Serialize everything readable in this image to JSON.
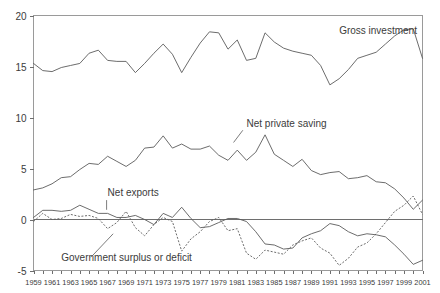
{
  "chart_data": {
    "type": "line",
    "title": "",
    "subtitle": "",
    "xlabel": "",
    "ylabel": "",
    "xlim": [
      1959,
      2001
    ],
    "ylim": [
      -5,
      20
    ],
    "yticks": [
      -5,
      0,
      5,
      10,
      15,
      20
    ],
    "ytick_labels": [
      "-5",
      "0",
      "5",
      "10",
      "15",
      "20"
    ],
    "grid": false,
    "legend_position": "inline-annotations",
    "zero_reference_line": 0,
    "x": [
      1959,
      1960,
      1961,
      1962,
      1963,
      1964,
      1965,
      1966,
      1967,
      1968,
      1969,
      1970,
      1971,
      1972,
      1973,
      1974,
      1975,
      1976,
      1977,
      1978,
      1979,
      1980,
      1981,
      1982,
      1983,
      1984,
      1985,
      1986,
      1987,
      1988,
      1989,
      1990,
      1991,
      1992,
      1993,
      1994,
      1995,
      1996,
      1997,
      1998,
      1999,
      2000,
      2001
    ],
    "xtick_labels": [
      "1959",
      "1961",
      "1963",
      "1965",
      "1967",
      "1969",
      "1971",
      "1973",
      "1975",
      "1977",
      "1979",
      "1981",
      "1983",
      "1985",
      "1987",
      "1989",
      "1991",
      "1993",
      "1995",
      "1997",
      "1999",
      "2001"
    ],
    "series": [
      {
        "name": "Gross investment",
        "style": "solid",
        "label_x": 1992,
        "label_y": 18.2,
        "values": [
          15.3,
          14.6,
          14.5,
          14.9,
          15.1,
          15.3,
          16.3,
          16.6,
          15.6,
          15.5,
          15.5,
          14.4,
          15.3,
          16.3,
          17.2,
          16.2,
          14.4,
          15.9,
          17.3,
          18.4,
          18.3,
          16.7,
          17.6,
          15.6,
          15.8,
          18.3,
          17.4,
          16.8,
          16.5,
          16.3,
          16.1,
          15.1,
          13.2,
          13.8,
          14.7,
          15.8,
          16.1,
          16.4,
          17.2,
          18.0,
          18.6,
          18.7,
          15.8
        ]
      },
      {
        "name": "Net private saving",
        "style": "solid",
        "label_x": 1982,
        "label_y": 9.1,
        "values": [
          2.9,
          3.1,
          3.5,
          4.1,
          4.2,
          4.9,
          5.5,
          5.4,
          6.2,
          5.7,
          5.2,
          5.8,
          7.0,
          7.1,
          8.2,
          7.0,
          7.4,
          6.9,
          6.9,
          7.2,
          6.3,
          5.8,
          6.8,
          5.8,
          6.6,
          8.3,
          6.4,
          5.8,
          5.2,
          5.9,
          4.8,
          4.4,
          4.6,
          4.7,
          4.0,
          4.1,
          4.3,
          3.7,
          3.6,
          3.0,
          2.1,
          1.0,
          1.9
        ]
      },
      {
        "name": "Net exports",
        "style": "solid",
        "label_x": 1967,
        "label_y": 2.3,
        "values": [
          0.2,
          0.9,
          0.9,
          0.8,
          0.9,
          1.4,
          1.0,
          0.6,
          0.6,
          0.2,
          0.2,
          0.4,
          0.0,
          -0.5,
          0.6,
          0.2,
          1.2,
          0.1,
          -0.8,
          -0.7,
          -0.3,
          0.1,
          0.1,
          -0.2,
          -1.2,
          -2.4,
          -2.5,
          -2.9,
          -2.8,
          -1.8,
          -1.4,
          -1.1,
          -0.4,
          -0.6,
          -1.2,
          -1.6,
          -1.4,
          -1.5,
          -1.7,
          -2.5,
          -3.4,
          -4.4,
          -4.0
        ]
      },
      {
        "name": "Government surplus or deficit",
        "style": "dotted",
        "label_x": 1962,
        "label_y": -4.1,
        "values": [
          -0.2,
          0.6,
          0.0,
          0.1,
          0.5,
          0.3,
          0.4,
          0.1,
          -0.9,
          -0.3,
          0.8,
          -0.8,
          -1.6,
          -0.5,
          0.2,
          -0.2,
          -3.1,
          -1.9,
          -1.2,
          -0.2,
          0.2,
          -1.1,
          -0.9,
          -3.3,
          -3.9,
          -3.0,
          -3.2,
          -3.4,
          -2.5,
          -2.1,
          -1.8,
          -2.8,
          -3.3,
          -4.5,
          -3.8,
          -2.7,
          -2.3,
          -1.4,
          -0.3,
          0.8,
          1.4,
          2.3,
          0.5
        ]
      }
    ]
  },
  "labels": {
    "gross_investment": "Gross investment",
    "net_private_saving": "Net private saving",
    "net_exports": "Net exports",
    "government_surplus": "Government surplus or deficit"
  }
}
